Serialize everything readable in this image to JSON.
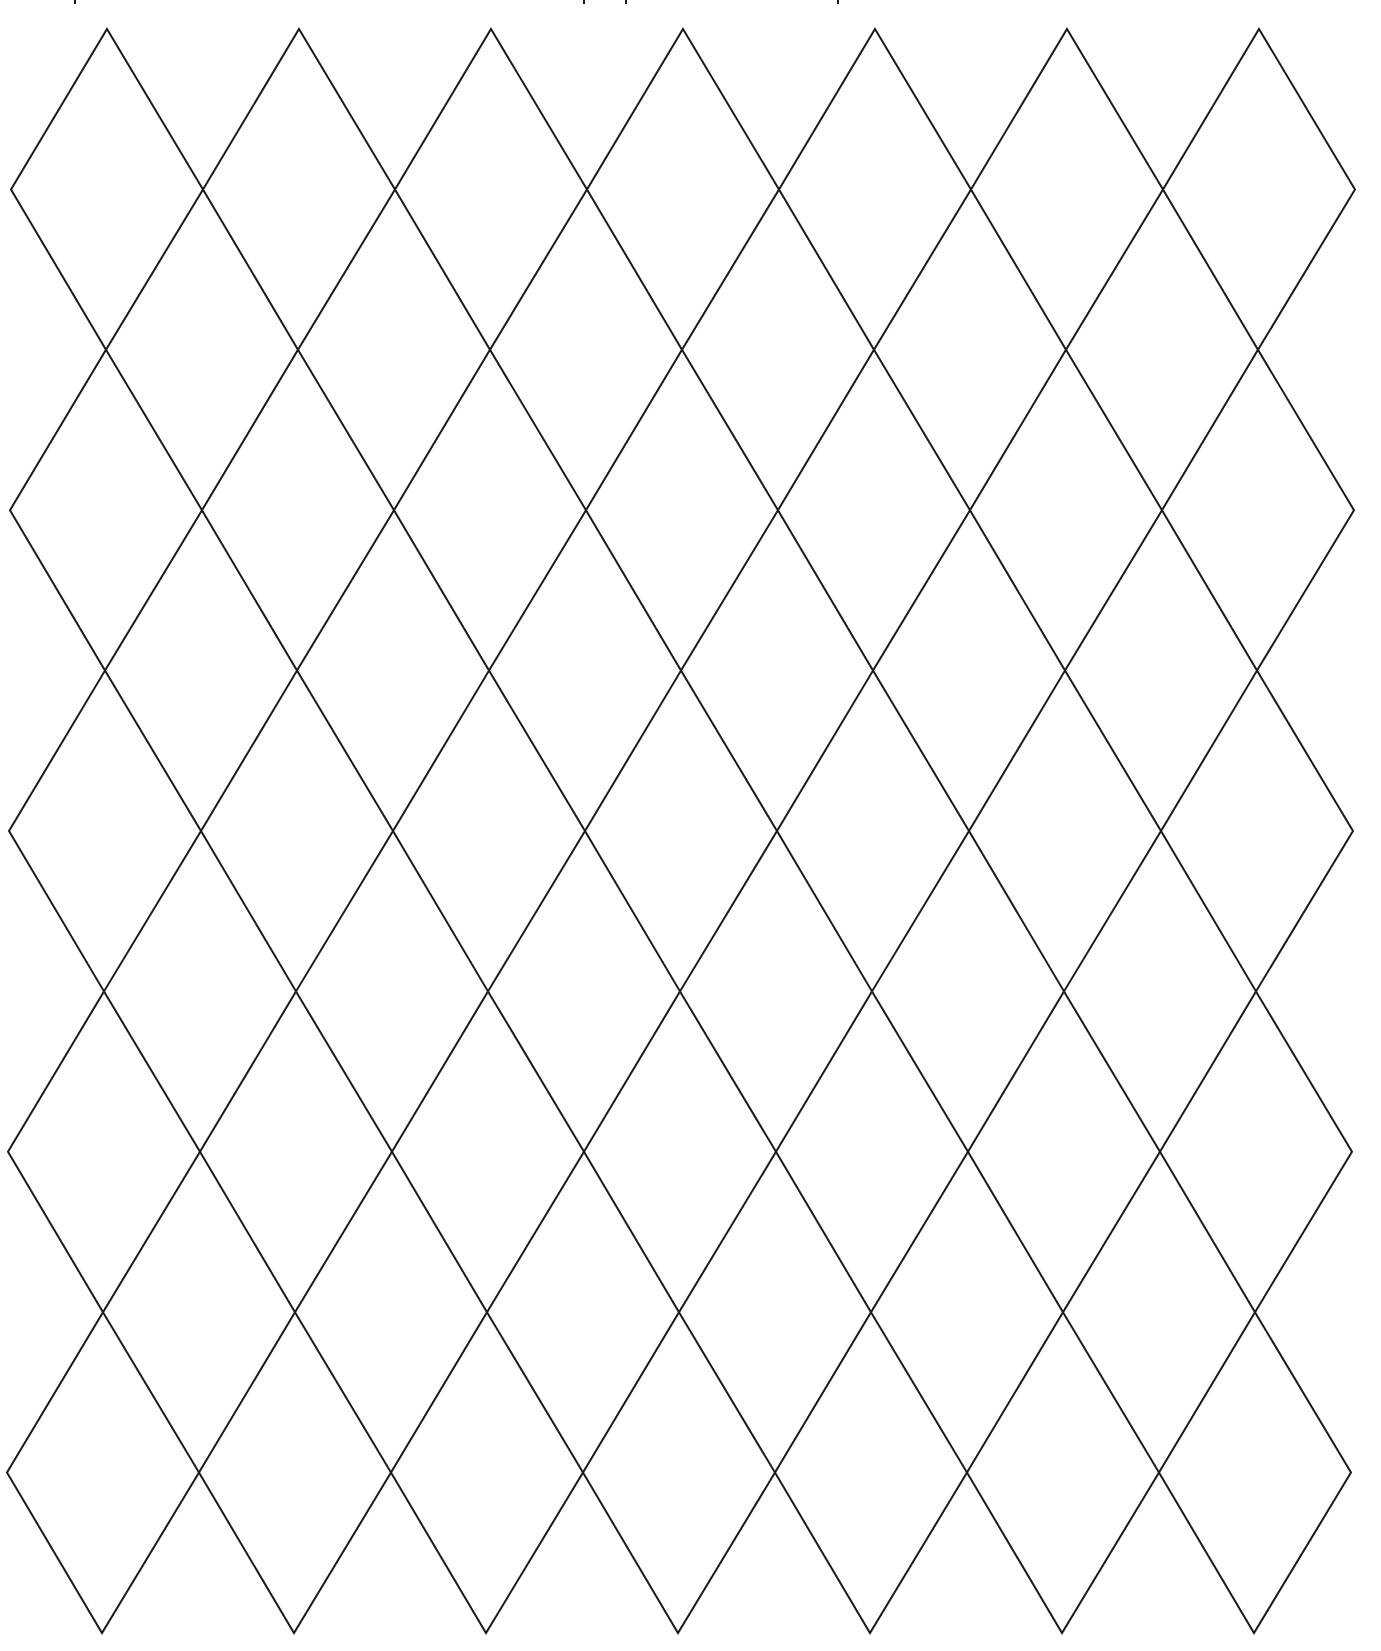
{
  "page": {
    "title": "Diamond (harlequin) grid template",
    "background": "#ffffff",
    "line_color": "#1a1a1a",
    "line_width": 2
  },
  "cutoff_text": {
    "description": "Descender fragments of a text line cropped off the top edge (illegible)",
    "mark_x": [
      74,
      583,
      625,
      837
    ]
  },
  "grid": {
    "columns": 7,
    "rows": 5,
    "first_apex_x": 107,
    "column_spacing": 192,
    "half_width": 96,
    "top_y": 29,
    "row_spacing": 320.8,
    "half_height": 160.4,
    "row_x_drift": -1
  }
}
